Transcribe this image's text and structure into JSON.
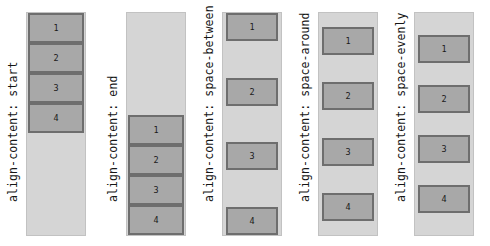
{
  "page": {
    "background_color": "#ffffff",
    "container_color": "#d5d5d5",
    "container_border_color": "#c2c2c2",
    "item_color": "#a8a8a8",
    "item_border_color": "#6e6e6e",
    "text_color": "#151515"
  },
  "demos": [
    {
      "label": "align-content: start",
      "mode": "start",
      "items": [
        "1",
        "2",
        "3",
        "4"
      ]
    },
    {
      "label": "align-content: end",
      "mode": "end",
      "items": [
        "1",
        "2",
        "3",
        "4"
      ]
    },
    {
      "label": "align-content: space-between",
      "mode": "between",
      "items": [
        "1",
        "2",
        "3",
        "4"
      ]
    },
    {
      "label": "align-content: space-around",
      "mode": "around",
      "items": [
        "1",
        "2",
        "3",
        "4"
      ]
    },
    {
      "label": "align-content: space-evenly",
      "mode": "evenly",
      "items": [
        "1",
        "2",
        "3",
        "4"
      ]
    }
  ]
}
